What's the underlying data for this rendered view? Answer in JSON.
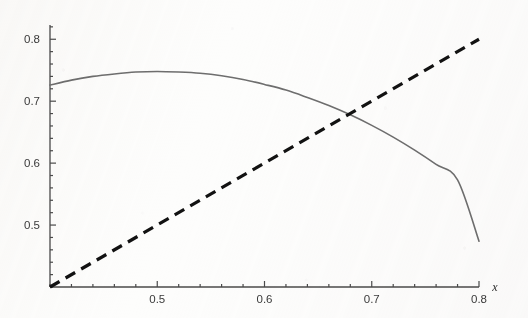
{
  "figure": {
    "background_color": "#fdfdfc",
    "axis_color": "#4a4a4a",
    "curve_color": "#6e6e6e",
    "line_color": "#121212"
  },
  "chart_data": {
    "type": "line",
    "title": "",
    "subtitle": "",
    "xlabel": "x",
    "ylabel": "",
    "xlim": [
      0.4,
      0.8
    ],
    "ylim": [
      0.4,
      0.823
    ],
    "grid": false,
    "legend": null,
    "x_ticks_major": [
      0.5,
      0.6,
      0.7,
      0.8
    ],
    "x_tick_labels": [
      "0.5",
      "0.6",
      "0.7",
      "0.8"
    ],
    "x_minor_tick_step": 0.02,
    "y_ticks_major": [
      0.5,
      0.6,
      0.7,
      0.8
    ],
    "y_tick_labels": [
      "0.5",
      "0.6",
      "0.7",
      "0.8"
    ],
    "y_minor_tick_step": 0.02,
    "annotations": [],
    "series": [
      {
        "name": "curve",
        "style": "solid",
        "color": "#6e6e6e",
        "width": 1.6,
        "x": [
          0.4,
          0.42,
          0.44,
          0.46,
          0.48,
          0.5,
          0.52,
          0.54,
          0.56,
          0.58,
          0.6,
          0.62,
          0.64,
          0.66,
          0.68,
          0.7,
          0.72,
          0.74,
          0.76,
          0.78,
          0.8
        ],
        "values": [
          0.726,
          0.734,
          0.74,
          0.744,
          0.747,
          0.748,
          0.747,
          0.745,
          0.741,
          0.735,
          0.727,
          0.718,
          0.706,
          0.693,
          0.678,
          0.661,
          0.642,
          0.621,
          0.598,
          0.573,
          0.474
        ]
      },
      {
        "name": "diagonal",
        "style": "dashed",
        "color": "#121212",
        "width": 3.2,
        "x": [
          0.4,
          0.8
        ],
        "values": [
          0.4,
          0.8
        ]
      }
    ],
    "intersection": {
      "x": 0.67,
      "y": 0.66
    }
  }
}
